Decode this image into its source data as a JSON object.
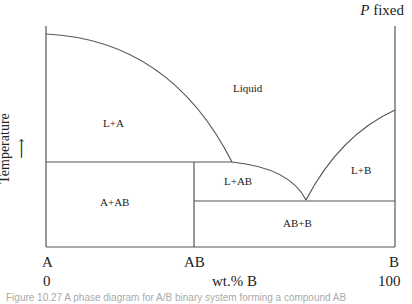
{
  "title": {
    "var": "P",
    "text": "fixed"
  },
  "y_axis": {
    "label": "Temperature"
  },
  "x_axis": {
    "label": "wt.% B",
    "ticks": [
      {
        "label": "A",
        "value": "0"
      },
      {
        "label": "AB",
        "value": ""
      },
      {
        "label": "B",
        "value": "100"
      }
    ]
  },
  "regions": {
    "liquid": "Liquid",
    "l_a": "L+A",
    "l_ab": "L+AB",
    "l_b": "L+B",
    "a_ab": "A+AB",
    "ab_b": "AB+B"
  },
  "caption": "Figure 10.27 A phase diagram for A/B binary system forming a compound AB",
  "colors": {
    "line": "#555555",
    "text": "#222222"
  }
}
